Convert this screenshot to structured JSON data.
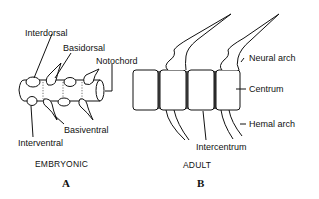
{
  "figure": {
    "panel_a": {
      "letter": "A",
      "caption": "EMBRYONIC",
      "labels": {
        "interdorsal": "Interdorsal",
        "basidorsal": "Basidorsal",
        "notochord": "Notochord",
        "basiventral": "Basiventral",
        "interventral": "Interventral"
      }
    },
    "panel_b": {
      "letter": "B",
      "caption": "ADULT",
      "labels": {
        "neural_arch": "Neural arch",
        "centrum": "Centrum",
        "hemal_arch": "Hemal arch",
        "intercentrum": "Intercentrum"
      }
    },
    "colors": {
      "ink": "#111111",
      "background": "#ffffff"
    }
  }
}
